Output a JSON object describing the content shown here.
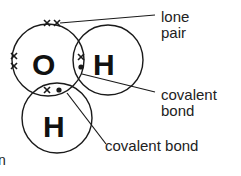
{
  "diagram": {
    "atoms": [
      {
        "symbol": "O",
        "cx": 48,
        "cy": 60,
        "r": 36
      },
      {
        "symbol": "H",
        "cx": 108,
        "cy": 60,
        "r": 35
      },
      {
        "symbol": "H",
        "cx": 57,
        "cy": 118,
        "r": 35
      }
    ],
    "labels": {
      "lone_pair_line1": "lone",
      "lone_pair_line2": "pair",
      "covalent_bond_1_line1": "covalent",
      "covalent_bond_1_line2": "bond",
      "covalent_bond_2": "covalent bond",
      "cropped_fragment": "n"
    },
    "colors": {
      "stroke": "#1a1a1a",
      "text": "#222222",
      "background": "#ffffff"
    }
  }
}
